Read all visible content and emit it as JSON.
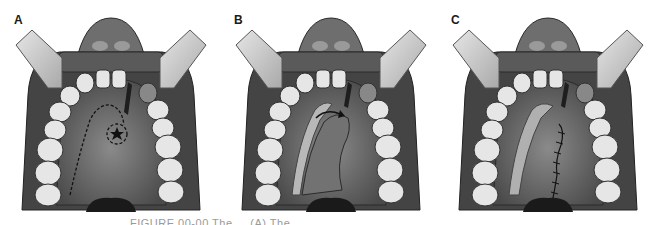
{
  "figure": {
    "panels": [
      {
        "label": "A",
        "description": "Oral cavity with retractors; dashed outline of palatal flap incision and dashed circle around star marking the fistula site",
        "marker": "star"
      },
      {
        "label": "B",
        "description": "Palatal flap elevated and rotated toward the defect; curved arrow indicating rotation",
        "marker": "curved-arrow"
      },
      {
        "label": "C",
        "description": "Flap rotated into position and sutured along the midline closure",
        "marker": "suture-line"
      }
    ],
    "caption": "FIGURE 00-00  The ... (A) The ..."
  },
  "colors": {
    "tissue_dark": "#3c3c3c",
    "tissue_mid": "#6b6b6b",
    "palate": "#7a7a7a",
    "teeth": "#e8e8e8",
    "retractor": "#c8c8c8"
  }
}
